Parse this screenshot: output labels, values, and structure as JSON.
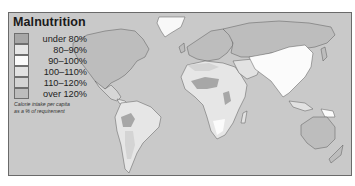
{
  "map": {
    "title": "Malnutrition",
    "caption_line1": "Calorie intake per capita",
    "caption_line2": "as a % of requirement",
    "ocean_color": "#c9c9c9",
    "legend": [
      {
        "label": "under 80%",
        "color": "#a7a7a7"
      },
      {
        "label": "80–90%",
        "color": "#e6e6e6"
      },
      {
        "label": "90–100%",
        "color": "#fbfbfb"
      },
      {
        "label": "100–110%",
        "color": "#e2e2e2"
      },
      {
        "label": "110–120%",
        "color": "#d4d4d4"
      },
      {
        "label": "over 120%",
        "color": "#bdbdbd"
      }
    ]
  }
}
